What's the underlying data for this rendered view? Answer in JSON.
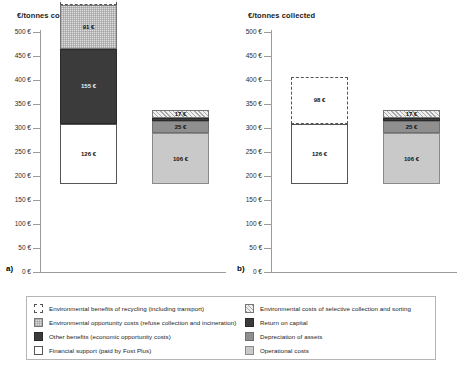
{
  "chart_data": {
    "type": "bar",
    "title": "",
    "ylabel": "€/tonnes collected",
    "xlabel": "",
    "ylim": [
      0,
      500
    ],
    "ytick_step": 50,
    "ytick_labels": [
      "0 €",
      "50 €",
      "100 €",
      "150 €",
      "200 €",
      "250 €",
      "300 €",
      "350 €",
      "400 €",
      "450 €",
      "500 €"
    ],
    "grid": false,
    "legend_position": "bottom",
    "stacked": true,
    "panels": [
      {
        "tag": "a)",
        "axis_title": "€/tonnes collected",
        "bars": [
          {
            "name": "benefits-bar",
            "segments": [
              {
                "key": "financial_support",
                "label": "126 €",
                "value": 126,
                "style": "fill-financial"
              },
              {
                "key": "other_benefits",
                "label": "155 €",
                "value": 155,
                "style": "fill-other"
              },
              {
                "key": "environmental_opportunity_costs",
                "label": "91 €",
                "value": 91,
                "style": "fill-envopp"
              },
              {
                "key": "environmental_benefits_recycling",
                "label": "98 €",
                "value": 98,
                "style": "fill-benefit"
              }
            ]
          },
          {
            "name": "costs-bar",
            "segments": [
              {
                "key": "operational_costs",
                "label": "106 €",
                "value": 106,
                "style": "fill-oper"
              },
              {
                "key": "depreciation_of_assets",
                "label": "25 €",
                "value": 25,
                "style": "fill-depr"
              },
              {
                "key": "return_on_capital",
                "label": "",
                "value": 7,
                "style": "fill-return"
              },
              {
                "key": "environmental_costs_selective",
                "label": "17 €",
                "value": 17,
                "style": "fill-envcost"
              }
            ]
          }
        ]
      },
      {
        "tag": "b)",
        "axis_title": "€/tonnes collected",
        "bars": [
          {
            "name": "benefits-bar",
            "segments": [
              {
                "key": "financial_support",
                "label": "126 €",
                "value": 126,
                "style": "fill-financial"
              },
              {
                "key": "environmental_benefits_recycling",
                "label": "98 €",
                "value": 98,
                "style": "fill-benefit"
              }
            ]
          },
          {
            "name": "costs-bar",
            "segments": [
              {
                "key": "operational_costs",
                "label": "106 €",
                "value": 106,
                "style": "fill-oper"
              },
              {
                "key": "depreciation_of_assets",
                "label": "25 €",
                "value": 25,
                "style": "fill-depr"
              },
              {
                "key": "return_on_capital",
                "label": "",
                "value": 7,
                "style": "fill-return"
              },
              {
                "key": "environmental_costs_selective",
                "label": "17 €",
                "value": 17,
                "style": "fill-envcost"
              }
            ]
          }
        ]
      }
    ],
    "legend": {
      "left": [
        {
          "key": "environmental_benefits_recycling",
          "label": "Environmental benefits of recycling (including transport)",
          "style": "fill-benefit"
        },
        {
          "key": "environmental_opportunity_costs",
          "label": "Environmental opportunity costs (refuse collection and incineration)",
          "style": "fill-envopp"
        },
        {
          "key": "other_benefits",
          "label": "Other benefits (economic opportunity costs)",
          "style": "fill-other"
        },
        {
          "key": "financial_support",
          "label": "Financial support (paid by Fost Plus)",
          "style": "fill-financial"
        }
      ],
      "right": [
        {
          "key": "environmental_costs_selective",
          "label": "Environmental costs of selective collection and sorting",
          "style": "fill-envcost"
        },
        {
          "key": "return_on_capital",
          "label": "Return on capital",
          "style": "fill-return"
        },
        {
          "key": "depreciation_of_assets",
          "label": "Depreciation of assets",
          "style": "fill-depr"
        },
        {
          "key": "operational_costs",
          "label": "Operational costs",
          "style": "fill-oper"
        }
      ]
    }
  }
}
